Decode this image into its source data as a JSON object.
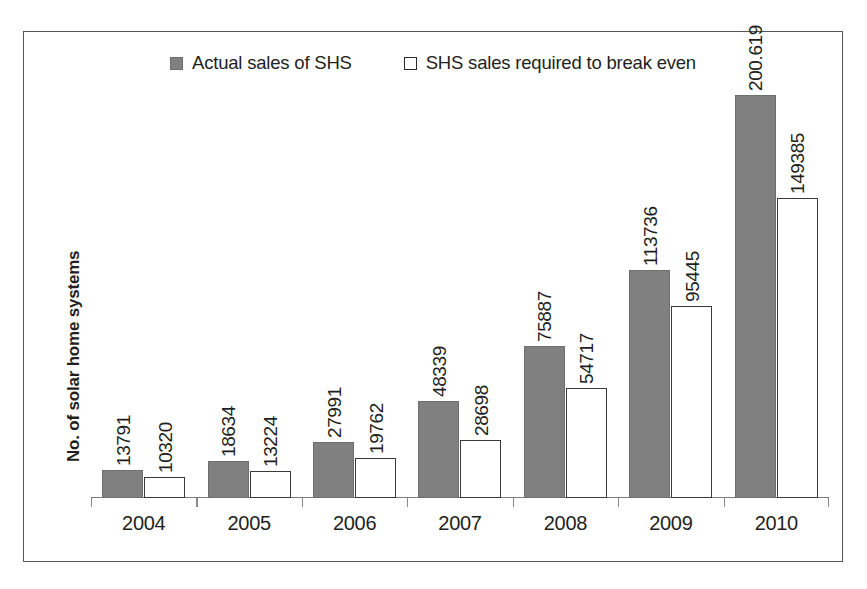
{
  "chart_data": {
    "type": "bar",
    "title": "",
    "xlabel": "",
    "ylabel": "No. of solar home systems",
    "categories": [
      "2004",
      "2005",
      "2006",
      "2007",
      "2008",
      "2009",
      "2010"
    ],
    "series": [
      {
        "name": "Actual sales of SHS",
        "marker": "filled-square",
        "color": "#808080",
        "values": [
          13791,
          18634,
          27991,
          48339,
          75887,
          113736,
          200619
        ],
        "labels": [
          "13791",
          "18634",
          "27991",
          "48339",
          "75887",
          "113736",
          "200.619"
        ]
      },
      {
        "name": "SHS sales required to break even",
        "marker": "hollow-square",
        "color": "#ffffff",
        "values": [
          10320,
          13224,
          19762,
          28698,
          54717,
          95445,
          149385
        ],
        "labels": [
          "10320",
          "13224",
          "19762",
          "28698",
          "54717",
          "95445",
          "149385"
        ]
      }
    ],
    "ylim": [
      0,
      225000
    ],
    "grid": false,
    "legend_position": "top-center",
    "data_labels_rotation": "vertical"
  },
  "legend": {
    "items": [
      {
        "label": "Actual sales of SHS",
        "swatch": "filled-square"
      },
      {
        "label": "SHS sales required to break even",
        "swatch": "hollow-square"
      }
    ]
  },
  "axes": {
    "y_title": "No. of solar home systems",
    "x_ticks": [
      "2004",
      "2005",
      "2006",
      "2007",
      "2008",
      "2009",
      "2010"
    ]
  },
  "colors": {
    "series_actual": "#808080",
    "series_required": "#ffffff",
    "border": "#58585a",
    "text": "#231f20",
    "axis": "#7d7d7d"
  }
}
